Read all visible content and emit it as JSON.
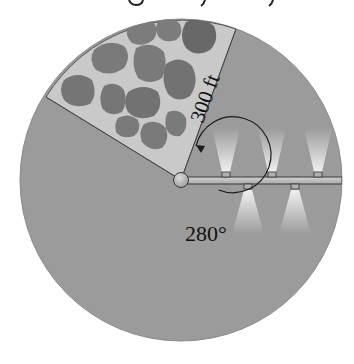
{
  "diagram": {
    "top_text_fragment": "g  y  y",
    "labels": {
      "radius": "300 ft",
      "angle": "280°"
    },
    "colors": {
      "field": "#9b9b9b",
      "rock_bed": "#c9c9c9",
      "rock": "#7c7c7c",
      "rock_shade": "#606060",
      "pipe": "#bdbdbd",
      "outline": "#3a3a3a",
      "spray": "#e8e8e8"
    },
    "sprinklers": {
      "top": 3,
      "bottom": 2
    }
  }
}
